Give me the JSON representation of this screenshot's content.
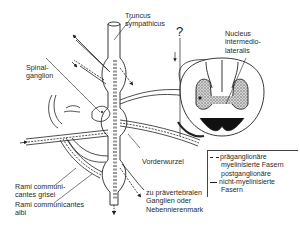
{
  "diagram": {
    "labels": {
      "truncus": [
        "Truncus",
        "sympathicus"
      ],
      "nucleus": [
        "Nucleus",
        "intermedio-",
        "lateralis"
      ],
      "spinalganglion": [
        "Spinal-",
        "ganglion"
      ],
      "vorderwurzel": "Vorderwurzel",
      "rami_grisei": [
        "Rami communi-",
        "cantes grisei"
      ],
      "rami_albi": [
        "Rami communicantes",
        "albi"
      ],
      "praevertebral": [
        "zu prävertebralen",
        "Ganglien oder",
        "Nebennierenmark"
      ],
      "question": "?"
    },
    "legend": {
      "pre": [
        "präganglionäre",
        "myelinisierte Fasern"
      ],
      "post": [
        "postganglionäre",
        "nicht-myelinisierte",
        "Fasern"
      ]
    },
    "colors": {
      "line": "#222222",
      "gray_matter": "#9a9a9a",
      "background": "#ffffff"
    }
  }
}
